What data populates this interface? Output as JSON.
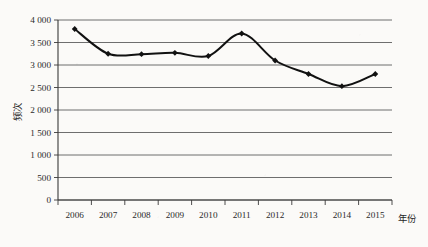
{
  "chart_data": {
    "type": "line",
    "title": "",
    "xlabel": "年份",
    "ylabel": "频次",
    "categories": [
      "2006",
      "2007",
      "2008",
      "2009",
      "2010",
      "2011",
      "2012",
      "2013",
      "2014",
      "2015"
    ],
    "values": [
      3800,
      3250,
      3240,
      3270,
      3200,
      3700,
      3100,
      2800,
      2530,
      2800
    ],
    "series": [
      {
        "name": "频次",
        "values": [
          3800,
          3250,
          3240,
          3270,
          3200,
          3700,
          3100,
          2800,
          2530,
          2800
        ]
      }
    ],
    "ylim": [
      0,
      4000
    ],
    "ytick_values": [
      0,
      500,
      1000,
      1500,
      2000,
      2500,
      3000,
      3500,
      4000
    ],
    "ytick_labels": [
      "0",
      "500",
      "1 000",
      "1 500",
      "2 000",
      "2 500",
      "3 000",
      "3 500",
      "4 000"
    ],
    "xtick_labels": [
      "2006",
      "2007",
      "2008",
      "2009",
      "2010",
      "2011",
      "2012",
      "2013",
      "2014",
      "2015"
    ],
    "grid": "horizontal",
    "legend": "none",
    "line_color": "#111111",
    "marker": "diamond",
    "marker_color": "#111111",
    "background_color": "#fbfaf8",
    "smoothing": "spline"
  },
  "axis": {
    "x_title": "年份",
    "y_title": "频次"
  }
}
